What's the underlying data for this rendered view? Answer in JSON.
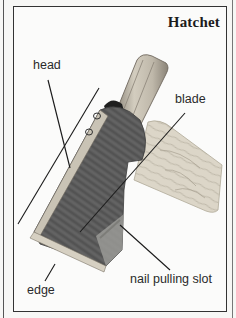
{
  "figure": {
    "title": "Hatchet",
    "labels": {
      "head": "head",
      "blade": "blade",
      "nail_slot": "nail pulling slot",
      "edge": "edge"
    },
    "colors": {
      "frame": "#333333",
      "head_metal": "#5a5a5a",
      "handle_wood": "#d8d2c4",
      "shaft": "#bdb6a8",
      "edge_band": "#d6d0c2"
    }
  }
}
